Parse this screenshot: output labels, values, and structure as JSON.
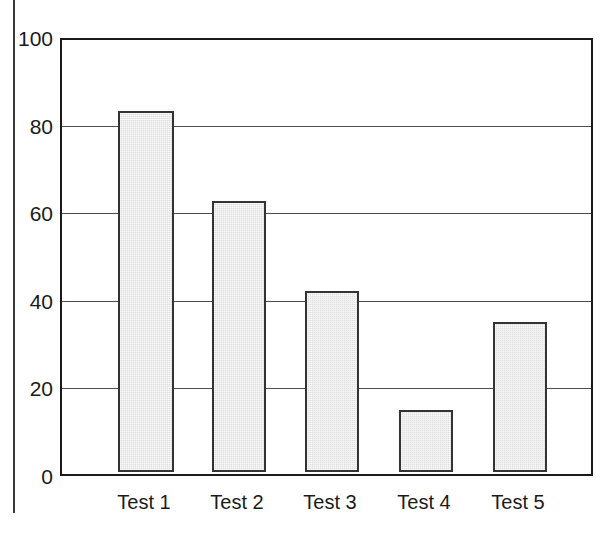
{
  "chart_data": {
    "type": "bar",
    "title": "",
    "subtitle": "",
    "xlabel": "",
    "ylabel": "",
    "categories": [
      "Test 1",
      "Test 2",
      "Test 3",
      "Test 4",
      "Test 5"
    ],
    "values": [
      84,
      63,
      42,
      14.5,
      35
    ],
    "ylim": [
      0,
      100
    ],
    "ytick_labels": [
      "0",
      "20",
      "40",
      "60",
      "80",
      "100"
    ],
    "yticks": [
      0,
      20,
      40,
      60,
      80,
      100
    ],
    "grid": "horizontal",
    "legend": "none",
    "annotations": [],
    "colors": {
      "bar_fill": "#dedede",
      "bar_border": "#333333",
      "frame": "#1a1a1a",
      "gridline": "#4d4d4d",
      "text": "#1a1a1a",
      "background": "#ffffff",
      "margin_rule": "#3a3a3a"
    }
  },
  "ticks": {
    "t0": "0",
    "t20": "20",
    "t40": "40",
    "t60": "60",
    "t80": "80",
    "t100": "100"
  },
  "categories": {
    "c0": "Test 1",
    "c1": "Test 2",
    "c2": "Test 3",
    "c3": "Test 4",
    "c4": "Test 5"
  }
}
